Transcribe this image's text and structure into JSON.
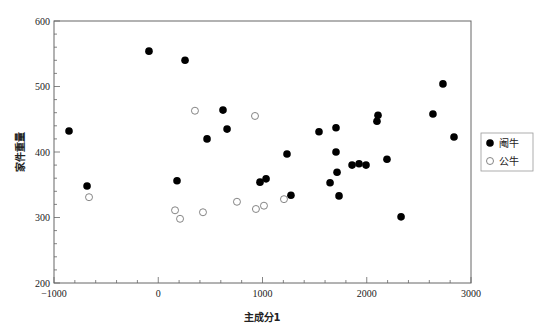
{
  "chart_data": {
    "type": "scatter",
    "title": "",
    "xlabel": "主成分1",
    "ylabel": "家件重量",
    "xlim": [
      -1000,
      3000
    ],
    "ylim": [
      200,
      600
    ],
    "xticks": [
      -1000,
      0,
      1000,
      2000,
      3000
    ],
    "yticks": [
      200,
      300,
      400,
      500,
      600
    ],
    "x_minor_step": 200,
    "y_minor_step": 20,
    "grid": false,
    "legend_position": "right",
    "series": [
      {
        "name": "阉牛",
        "marker": "filled-circle",
        "color": "#000000",
        "points": [
          [
            -856,
            432
          ],
          [
            -683,
            348
          ],
          [
            -89,
            554
          ],
          [
            257,
            540
          ],
          [
            180,
            356
          ],
          [
            621,
            464
          ],
          [
            660,
            435
          ],
          [
            468,
            420
          ],
          [
            976,
            354
          ],
          [
            1034,
            359
          ],
          [
            1273,
            334
          ],
          [
            1235,
            397
          ],
          [
            1542,
            431
          ],
          [
            1705,
            437
          ],
          [
            1705,
            400
          ],
          [
            1648,
            353
          ],
          [
            1715,
            369
          ],
          [
            1734,
            333
          ],
          [
            1859,
            380
          ],
          [
            1926,
            382
          ],
          [
            1993,
            380
          ],
          [
            2194,
            389
          ],
          [
            2108,
            456
          ],
          [
            2098,
            447
          ],
          [
            2329,
            301
          ],
          [
            2635,
            458
          ],
          [
            2731,
            504
          ],
          [
            2837,
            423
          ]
        ]
      },
      {
        "name": "公牛",
        "marker": "open-circle",
        "color": "#888888",
        "points": [
          [
            -664,
            331
          ],
          [
            161,
            311
          ],
          [
            209,
            298
          ],
          [
            352,
            463
          ],
          [
            429,
            308
          ],
          [
            755,
            324
          ],
          [
            928,
            455
          ],
          [
            937,
            313
          ],
          [
            1014,
            318
          ],
          [
            1206,
            328
          ]
        ]
      }
    ]
  },
  "axes": {
    "x_title": "主成分1",
    "y_title": "家件重量"
  },
  "legend": {
    "items": [
      {
        "label": "阉牛",
        "marker": "filled"
      },
      {
        "label": "公牛",
        "marker": "open"
      }
    ]
  }
}
